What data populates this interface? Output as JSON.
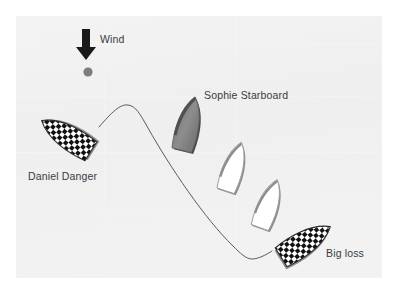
{
  "diagram": {
    "background_color": "#ffffff",
    "panel_color": "#f1f1f1",
    "panel": {
      "x": 16,
      "y": 16,
      "width": 366,
      "height": 262
    }
  },
  "wind": {
    "label": "Wind",
    "label_x": 100,
    "label_y": 43,
    "arrow_color": "#1a1a1a",
    "arrow_x": 86,
    "arrow_top": 29,
    "arrow_bottom": 59,
    "direction": "down"
  },
  "mark": {
    "name": "racing-mark-buoy",
    "color": "#7d7d7d",
    "cx": 88,
    "cy": 72,
    "r": 4.6
  },
  "track": {
    "name": "boat-track-path",
    "color": "#4a4a4a",
    "width": 0.9,
    "path": "M 99,127 C 112,112 120,104 128,105 C 136,106 140,114 148,128 C 170,167 205,219 233,246 C 240,253 246,259 252,259 C 258,259 266,255 272,251"
  },
  "boats": [
    {
      "id": "daniel-danger",
      "label": "Daniel Danger",
      "label_x": 28,
      "label_y": 180,
      "fill_style": "checker",
      "fill_color": "#ffffff",
      "checker_color": "#111111",
      "shadow_color": "#8e8e8e",
      "cx": 68,
      "cy": 137,
      "rotation": -58,
      "length": 62,
      "beam": 27
    },
    {
      "id": "sophie-starboard",
      "label": "Sophie Starboard",
      "label_x": 204,
      "label_y": 99,
      "fill_style": "solid-gray",
      "fill_color": "#8b8b8b",
      "edge_color": "#4f4f4f",
      "shadow_color": "#555555",
      "cx": 188,
      "cy": 125,
      "rotation": 14,
      "length": 58,
      "beam": 26
    },
    {
      "id": "sophie-position-2",
      "label": "",
      "fill_style": "white",
      "fill_color": "#ffffff",
      "edge_color": "#9a9a9a",
      "shadow_color": "#8e8e8e",
      "cx": 233,
      "cy": 168,
      "rotation": 18,
      "length": 54,
      "beam": 25
    },
    {
      "id": "sophie-position-3",
      "label": "",
      "fill_style": "white",
      "fill_color": "#ffffff",
      "edge_color": "#9a9a9a",
      "shadow_color": "#8e8e8e",
      "cx": 268,
      "cy": 205,
      "rotation": 20,
      "length": 54,
      "beam": 25
    },
    {
      "id": "big-loss",
      "label": "Big loss",
      "label_x": 326,
      "label_y": 257,
      "fill_style": "checker",
      "fill_color": "#ffffff",
      "checker_color": "#111111",
      "shadow_color": "#8e8e8e",
      "cx": 304,
      "cy": 243,
      "rotation": 58,
      "length": 62,
      "beam": 27
    }
  ]
}
